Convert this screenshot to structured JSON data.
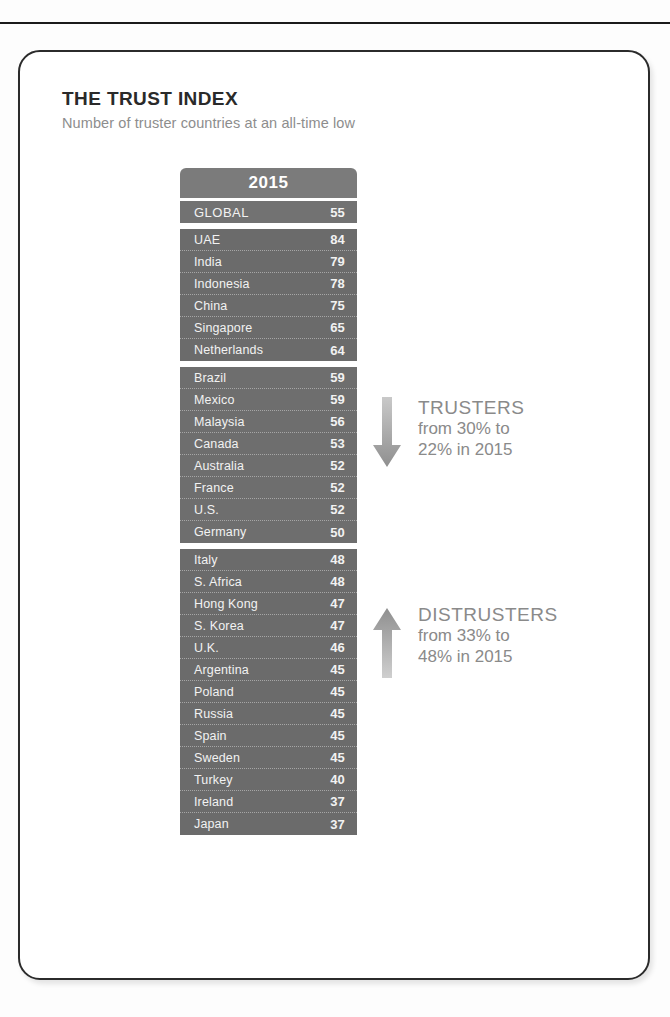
{
  "card": {
    "title": "THE TRUST INDEX",
    "subtitle": "Number of truster countries at an all-time low"
  },
  "table": {
    "header": "2015"
  },
  "annotations": {
    "trusters": {
      "icon": "arrow-down-icon",
      "heading": "TRUSTERS",
      "line1": "from 30% to",
      "line2": "22% in 2015"
    },
    "distrusters": {
      "icon": "arrow-up-icon",
      "heading": "DISTRUSTERS",
      "line1": "from 33% to",
      "line2": "48% in 2015"
    }
  },
  "colors": {
    "table_header": "#7b7b7b",
    "table_body": "#6e6e6e",
    "row_text": "#f2f2f2",
    "annotation_text": "#8a8a8a",
    "card_border": "#2b2b2b"
  },
  "chart_data": {
    "type": "table",
    "title": "THE TRUST INDEX",
    "subtitle": "Number of truster countries at an all-time low",
    "columns": [
      "Country",
      "2015"
    ],
    "xlabel": "",
    "ylabel": "Trust Index",
    "groups": [
      {
        "name": "global",
        "rows": [
          {
            "label": "GLOBAL",
            "value": 55
          }
        ]
      },
      {
        "name": "trusters-high",
        "rows": [
          {
            "label": "UAE",
            "value": 84
          },
          {
            "label": "India",
            "value": 79
          },
          {
            "label": "Indonesia",
            "value": 78
          },
          {
            "label": "China",
            "value": 75
          },
          {
            "label": "Singapore",
            "value": 65
          },
          {
            "label": "Netherlands",
            "value": 64
          }
        ]
      },
      {
        "name": "neutral",
        "rows": [
          {
            "label": "Brazil",
            "value": 59
          },
          {
            "label": "Mexico",
            "value": 59
          },
          {
            "label": "Malaysia",
            "value": 56
          },
          {
            "label": "Canada",
            "value": 53
          },
          {
            "label": "Australia",
            "value": 52
          },
          {
            "label": "France",
            "value": 52
          },
          {
            "label": "U.S.",
            "value": 52
          },
          {
            "label": "Germany",
            "value": 50
          }
        ]
      },
      {
        "name": "distrusters",
        "rows": [
          {
            "label": "Italy",
            "value": 48
          },
          {
            "label": "S. Africa",
            "value": 48
          },
          {
            "label": "Hong Kong",
            "value": 47
          },
          {
            "label": "S. Korea",
            "value": 47
          },
          {
            "label": "U.K.",
            "value": 46
          },
          {
            "label": "Argentina",
            "value": 45
          },
          {
            "label": "Poland",
            "value": 45
          },
          {
            "label": "Russia",
            "value": 45
          },
          {
            "label": "Spain",
            "value": 45
          },
          {
            "label": "Sweden",
            "value": 45
          },
          {
            "label": "Turkey",
            "value": 40
          },
          {
            "label": "Ireland",
            "value": 37
          },
          {
            "label": "Japan",
            "value": 37
          }
        ]
      }
    ],
    "categories": [
      "GLOBAL",
      "UAE",
      "India",
      "Indonesia",
      "China",
      "Singapore",
      "Netherlands",
      "Brazil",
      "Mexico",
      "Malaysia",
      "Canada",
      "Australia",
      "France",
      "U.S.",
      "Germany",
      "Italy",
      "S. Africa",
      "Hong Kong",
      "S. Korea",
      "U.K.",
      "Argentina",
      "Poland",
      "Russia",
      "Spain",
      "Sweden",
      "Turkey",
      "Ireland",
      "Japan"
    ],
    "values": [
      55,
      84,
      79,
      78,
      75,
      65,
      64,
      59,
      59,
      56,
      53,
      52,
      52,
      52,
      50,
      48,
      48,
      47,
      47,
      46,
      45,
      45,
      45,
      45,
      45,
      40,
      37,
      37
    ],
    "annotations": [
      {
        "label": "TRUSTERS",
        "detail": "from 30% to 22% in 2015",
        "direction": "down"
      },
      {
        "label": "DISTRUSTERS",
        "detail": "from 33% to 48% in 2015",
        "direction": "up"
      }
    ]
  }
}
